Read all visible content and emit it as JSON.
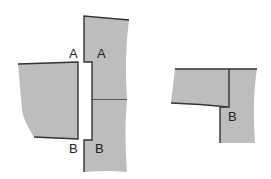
{
  "diagram": {
    "left_figure": {
      "labels": {
        "a_left": "A",
        "a_right": "A",
        "b_left": "B",
        "b_right": "B"
      }
    },
    "right_figure": {
      "labels": {
        "b": "B"
      }
    },
    "colors": {
      "fill": "#bdbdbd",
      "stroke": "#333333"
    }
  }
}
